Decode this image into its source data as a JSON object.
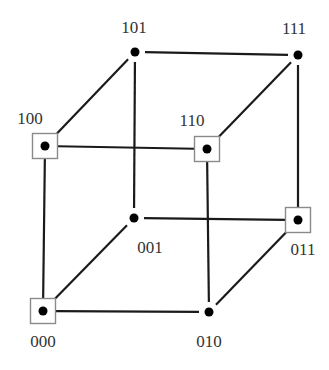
{
  "diagram": {
    "type": "3-cube (binary hypercube)",
    "nodes": [
      {
        "id": "000",
        "label": "000",
        "x": 43,
        "y": 311,
        "boxed": true,
        "label_x": 43,
        "label_y": 347,
        "anchor": "middle"
      },
      {
        "id": "001",
        "label": "001",
        "x": 134,
        "y": 218,
        "boxed": false,
        "label_x": 150,
        "label_y": 253,
        "anchor": "middle"
      },
      {
        "id": "010",
        "label": "010",
        "x": 209,
        "y": 312,
        "boxed": false,
        "label_x": 209,
        "label_y": 347,
        "anchor": "middle"
      },
      {
        "id": "011",
        "label": "011",
        "x": 298,
        "y": 220,
        "boxed": true,
        "label_x": 303,
        "label_y": 255,
        "anchor": "middle"
      },
      {
        "id": "100",
        "label": "100",
        "x": 45,
        "y": 146,
        "boxed": true,
        "label_x": 30,
        "label_y": 124,
        "anchor": "middle"
      },
      {
        "id": "101",
        "label": "101",
        "x": 135,
        "y": 52,
        "boxed": false,
        "label_x": 134,
        "label_y": 33,
        "anchor": "middle"
      },
      {
        "id": "110",
        "label": "110",
        "x": 207,
        "y": 149,
        "boxed": true,
        "label_x": 192,
        "label_y": 126,
        "anchor": "middle"
      },
      {
        "id": "111",
        "label": "111",
        "x": 298,
        "y": 55,
        "boxed": false,
        "label_x": 294,
        "label_y": 34,
        "anchor": "middle"
      }
    ],
    "edges": [
      {
        "from": "000",
        "to": "100"
      },
      {
        "from": "000",
        "to": "010"
      },
      {
        "from": "000",
        "to": "001"
      },
      {
        "from": "100",
        "to": "110"
      },
      {
        "from": "100",
        "to": "101"
      },
      {
        "from": "101",
        "to": "111"
      },
      {
        "from": "101",
        "to": "001"
      },
      {
        "from": "110",
        "to": "111"
      },
      {
        "from": "110",
        "to": "010"
      },
      {
        "from": "111",
        "to": "011"
      },
      {
        "from": "001",
        "to": "011"
      },
      {
        "from": "010",
        "to": "011"
      }
    ],
    "style": {
      "edge_color": "#1a1a1a",
      "dot_color": "#000000",
      "box_stroke": "#8a8a8a",
      "label_color": "#333333",
      "box_size": 25,
      "dot_radius": 4.5
    }
  }
}
